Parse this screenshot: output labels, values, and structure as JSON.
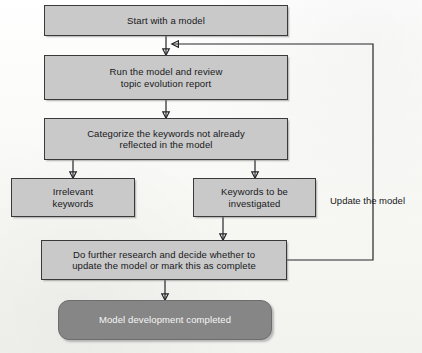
{
  "diagram": {
    "colors": {
      "node_fill": "#c9c9c9",
      "node_border": "#3a3a3a",
      "terminal_fill": "#868686",
      "terminal_text": "#f6f6f6",
      "connector": "#26262a",
      "background": "#fdfdfb"
    },
    "nodes": [
      {
        "id": "start",
        "label": "Start with a model",
        "shape": "rectangle",
        "x": 44,
        "y": 5,
        "w": 244,
        "h": 31
      },
      {
        "id": "run-model",
        "label": "Run the model and review\ntopic evolution report",
        "shape": "rectangle",
        "x": 44,
        "y": 55,
        "w": 244,
        "h": 45
      },
      {
        "id": "categorize",
        "label": "Categorize the keywords not already\nreflected in the model",
        "shape": "rectangle",
        "x": 44,
        "y": 118,
        "w": 244,
        "h": 42
      },
      {
        "id": "irrelevant",
        "label": "Irrelevant\nkeywords",
        "shape": "rectangle",
        "x": 11,
        "y": 178,
        "w": 124,
        "h": 39
      },
      {
        "id": "investigate",
        "label": "Keywords to be\ninvestigated",
        "shape": "rectangle",
        "x": 193,
        "y": 178,
        "w": 123,
        "h": 39
      },
      {
        "id": "research",
        "label": "Do further research and decide whether to\nupdate the model or mark this as complete",
        "shape": "rectangle",
        "x": 41,
        "y": 240,
        "w": 246,
        "h": 40
      },
      {
        "id": "completed",
        "label": "Model development completed",
        "shape": "rounded-rectangle",
        "x": 58,
        "y": 300,
        "w": 214,
        "h": 40
      }
    ],
    "edge_labels": [
      {
        "id": "update-the-model",
        "text": "Update the model",
        "x": 330,
        "y": 195
      }
    ],
    "edges": [
      {
        "from": "start",
        "to": "run-model"
      },
      {
        "from": "run-model",
        "to": "categorize"
      },
      {
        "from": "categorize",
        "to": "irrelevant"
      },
      {
        "from": "categorize",
        "to": "investigate"
      },
      {
        "from": "investigate",
        "to": "research"
      },
      {
        "from": "research",
        "to": "completed"
      },
      {
        "from": "research",
        "to": "run-model",
        "label": "Update the model",
        "routing": "feedback-loop-right"
      }
    ]
  }
}
